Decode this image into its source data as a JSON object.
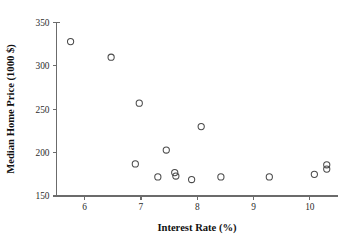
{
  "chart_data": {
    "type": "scatter",
    "title": "",
    "xlabel": "Interest Rate (%)",
    "ylabel": "Median Home Price (1000 $)",
    "xlim": [
      5.5,
      10.5
    ],
    "ylim": [
      150,
      350
    ],
    "xticks": [
      6,
      7,
      8,
      9,
      10
    ],
    "xtick_labels": [
      "6",
      "7",
      "8",
      "9",
      "10"
    ],
    "yticks": [
      150,
      200,
      250,
      300,
      350
    ],
    "ytick_labels": [
      "150",
      "200",
      "250",
      "300",
      "350"
    ],
    "grid": false,
    "legend": null,
    "marker": "open-circle",
    "marker_color": "#4a4a4a",
    "n_points": 14,
    "points": [
      {
        "x": 5.75,
        "y": 328
      },
      {
        "x": 6.47,
        "y": 310
      },
      {
        "x": 6.9,
        "y": 187
      },
      {
        "x": 6.97,
        "y": 257
      },
      {
        "x": 7.3,
        "y": 172
      },
      {
        "x": 7.45,
        "y": 203
      },
      {
        "x": 7.6,
        "y": 177
      },
      {
        "x": 7.62,
        "y": 173
      },
      {
        "x": 7.9,
        "y": 169
      },
      {
        "x": 8.07,
        "y": 230
      },
      {
        "x": 8.42,
        "y": 172
      },
      {
        "x": 9.28,
        "y": 172
      },
      {
        "x": 10.08,
        "y": 175
      },
      {
        "x": 10.3,
        "y": 186
      },
      {
        "x": 10.3,
        "y": 181
      }
    ]
  },
  "axes": {
    "x_title": "Interest Rate (%)",
    "y_title": "Median Home Price (1000 $)"
  }
}
